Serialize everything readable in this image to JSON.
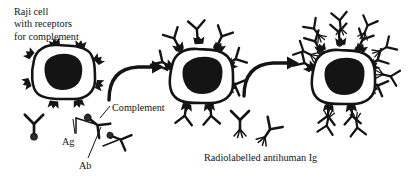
{
  "figure": {
    "type": "biology-diagram",
    "background_color": "#ffffff",
    "ink_color": "#141414"
  },
  "labels": {
    "raji_cell": "Raji cell\nwith receptors\nfor complement",
    "complement": "Complement",
    "antigen": "Ag",
    "antibody": "Ab",
    "radiolabelled": "Radiolabelled antihuman Ig"
  },
  "stages": [
    {
      "id": "stage-1",
      "name": "raji-cell-bare",
      "description": "Raji cell with free complement receptors",
      "receptor_count": 8,
      "bound_complexes": 0
    },
    {
      "id": "stage-2",
      "name": "raji-cell-with-immune-complexes",
      "description": "Immune complexes bound via complement to receptors",
      "receptor_count": 8,
      "bound_complexes": 8
    },
    {
      "id": "stage-3",
      "name": "raji-cell-with-radiolabelled-ig",
      "description": "Radiolabelled antihuman Ig bound to the immune complexes",
      "receptor_count": 8,
      "bound_complexes": 8,
      "radiolabelled_antibodies": 8
    }
  ],
  "free_reagents": [
    {
      "name": "antibody-with-complement",
      "label": "Ab + Complement",
      "count": 1
    },
    {
      "name": "antigen-antibody-complement-complex",
      "label": "Ag-Ab-Complement",
      "count": 2
    },
    {
      "name": "radiolabelled-antihuman-ig",
      "label": "Radiolabelled antihuman Ig",
      "count": 2
    }
  ],
  "arrows": [
    {
      "name": "arrow-stage1-to-stage2",
      "direction": "right"
    },
    {
      "name": "arrow-stage2-to-stage3",
      "direction": "right"
    }
  ]
}
